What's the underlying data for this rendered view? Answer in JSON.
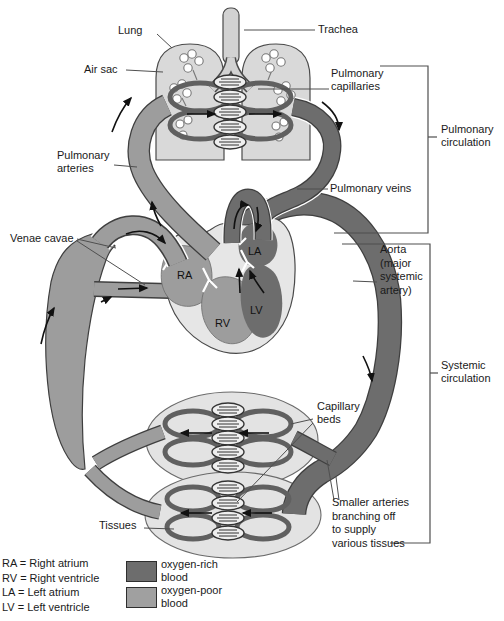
{
  "labels": {
    "lung": "Lung",
    "trachea": "Trachea",
    "air_sac": "Air sac",
    "pulmonary_capillaries": "Pulmonary\ncapillaries",
    "pulmonary_circulation": "Pulmonary\ncirculation",
    "pulmonary_arteries": "Pulmonary\narteries",
    "pulmonary_veins": "Pulmonary veins",
    "venae_cavae": "Venae cavae",
    "aorta": "Aorta\n(major\nsystemic\nartery)",
    "systemic_circulation": "Systemic\ncirculation",
    "capillary_beds": "Capillary\nbeds",
    "smaller_arteries": "Smaller arteries\nbranching off\nto supply\nvarious tissues",
    "tissues": "Tissues"
  },
  "heart": {
    "ra": "RA",
    "rv": "RV",
    "la": "LA",
    "lv": "LV"
  },
  "legend": {
    "abbreviations": [
      "RA = Right atrium",
      "RV = Right ventricle",
      "LA = Left atrium",
      "LV = Left ventricle"
    ],
    "swatches": [
      {
        "label": "oxygen-rich\nblood",
        "color": "#6d6d6d"
      },
      {
        "label": "oxygen-poor\nblood",
        "color": "#a0a0a0"
      }
    ]
  },
  "colors": {
    "oxygen_rich_blood": "#6d6d6d",
    "oxygen_poor_blood": "#9d9d9d",
    "organ_fill": "#d9d9d9",
    "heart_wall": "#e6e6e6"
  }
}
